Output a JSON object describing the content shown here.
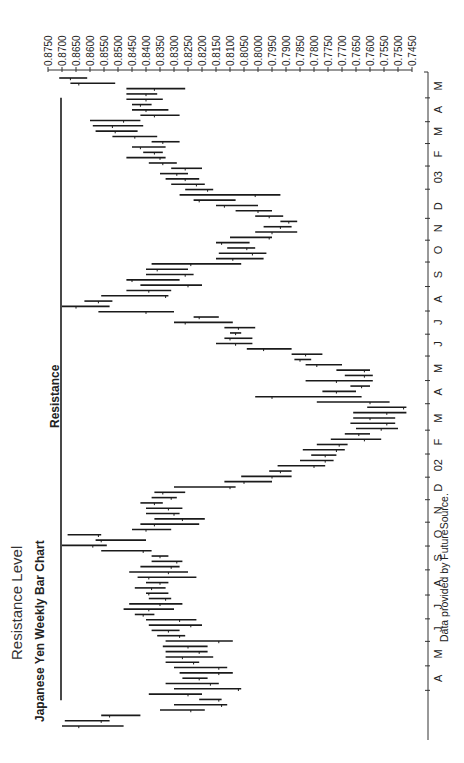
{
  "header": {
    "section_title": "Resistance Level",
    "chart_title": "Japanese Yen Weekly Bar Chart"
  },
  "annotation": {
    "resistance_label": "Resistance"
  },
  "footer": {
    "credit": "Data provided by FutureSource."
  },
  "colors": {
    "bars": "#1a1a1a",
    "axis": "#333333",
    "text": "#222222",
    "background": "#ffffff"
  },
  "chart_data": {
    "type": "bar",
    "subtype": "ohlc_weekly",
    "title": "Japanese Yen Weekly Bar Chart",
    "subtitle": "Resistance Level",
    "xlabel": "",
    "ylabel": "",
    "ylim": [
      0.745,
      0.875
    ],
    "y_ticks": [
      "0.8750",
      "0.8700",
      "0.8650",
      "0.8600",
      "0.8550",
      "0.8500",
      "0.8450",
      "0.8400",
      "0.8350",
      "0.8300",
      "0.8250",
      "0.8200",
      "0.8150",
      "0.8100",
      "0.8050",
      "0.8000",
      "0.7950",
      "0.7900",
      "0.7850",
      "0.7800",
      "0.7750",
      "0.7700",
      "0.7650",
      "0.7600",
      "0.7550",
      "0.7500",
      "0.7450"
    ],
    "x_ticks": [
      "A",
      "M",
      "J",
      "J",
      "A",
      "S",
      "O",
      "N",
      "D",
      "02",
      "F",
      "M",
      "A",
      "M",
      "J",
      "J",
      "A",
      "S",
      "O",
      "N",
      "D",
      "03",
      "F",
      "M",
      "A",
      "M"
    ],
    "x_tick_frac": [
      0.075,
      0.112,
      0.149,
      0.183,
      0.219,
      0.257,
      0.293,
      0.329,
      0.363,
      0.397,
      0.432,
      0.468,
      0.508,
      0.543,
      0.58,
      0.613,
      0.648,
      0.685,
      0.722,
      0.755,
      0.788,
      0.832,
      0.867,
      0.901,
      0.934,
      0.97
    ],
    "resistance_level": 0.87,
    "resistance_span_frac": [
      0.06,
      0.97
    ],
    "grid": false,
    "legend": null,
    "bars": [
      {
        "low": 0.848,
        "high": 0.87,
        "close": 0.864
      },
      {
        "low": 0.853,
        "high": 0.869,
        "close": 0.856
      },
      {
        "low": 0.842,
        "high": 0.856,
        "close": 0.853
      },
      {
        "low": 0.819,
        "high": 0.835,
        "close": 0.824
      },
      {
        "low": 0.811,
        "high": 0.83,
        "close": 0.813
      },
      {
        "low": 0.813,
        "high": 0.821,
        "close": 0.814
      },
      {
        "low": 0.82,
        "high": 0.839,
        "close": 0.825
      },
      {
        "low": 0.806,
        "high": 0.83,
        "close": 0.807
      },
      {
        "low": 0.814,
        "high": 0.833,
        "close": 0.817
      },
      {
        "low": 0.818,
        "high": 0.827,
        "close": 0.821
      },
      {
        "low": 0.809,
        "high": 0.828,
        "close": 0.814
      },
      {
        "low": 0.811,
        "high": 0.83,
        "close": 0.814
      },
      {
        "low": 0.821,
        "high": 0.833,
        "close": 0.823
      },
      {
        "low": 0.816,
        "high": 0.833,
        "close": 0.827
      },
      {
        "low": 0.818,
        "high": 0.833,
        "close": 0.821
      },
      {
        "low": 0.818,
        "high": 0.834,
        "close": 0.825
      },
      {
        "low": 0.809,
        "high": 0.833,
        "close": 0.814
      },
      {
        "low": 0.826,
        "high": 0.836,
        "close": 0.828
      },
      {
        "low": 0.828,
        "high": 0.838,
        "close": 0.832
      },
      {
        "low": 0.82,
        "high": 0.839,
        "close": 0.824
      },
      {
        "low": 0.822,
        "high": 0.84,
        "close": 0.828
      },
      {
        "low": 0.837,
        "high": 0.844,
        "close": 0.841
      },
      {
        "low": 0.83,
        "high": 0.848,
        "close": 0.839
      },
      {
        "low": 0.827,
        "high": 0.846,
        "close": 0.835
      },
      {
        "low": 0.831,
        "high": 0.839,
        "close": 0.833
      },
      {
        "low": 0.832,
        "high": 0.84,
        "close": 0.839
      },
      {
        "low": 0.833,
        "high": 0.844,
        "close": 0.838
      },
      {
        "low": 0.832,
        "high": 0.84,
        "close": 0.835
      },
      {
        "low": 0.822,
        "high": 0.843,
        "close": 0.839
      },
      {
        "low": 0.825,
        "high": 0.846,
        "close": 0.832
      },
      {
        "low": 0.828,
        "high": 0.842,
        "close": 0.831
      },
      {
        "low": 0.827,
        "high": 0.838,
        "close": 0.829
      },
      {
        "low": 0.832,
        "high": 0.838,
        "close": 0.835
      },
      {
        "low": 0.838,
        "high": 0.856,
        "close": 0.841
      },
      {
        "low": 0.854,
        "high": 0.87,
        "close": 0.859
      },
      {
        "low": 0.84,
        "high": 0.858,
        "close": 0.856
      },
      {
        "low": 0.856,
        "high": 0.868,
        "close": 0.857
      },
      {
        "low": 0.831,
        "high": 0.845,
        "close": 0.84
      },
      {
        "low": 0.821,
        "high": 0.842,
        "close": 0.837
      },
      {
        "low": 0.819,
        "high": 0.837,
        "close": 0.827
      },
      {
        "low": 0.828,
        "high": 0.84,
        "close": 0.83
      },
      {
        "low": 0.827,
        "high": 0.84,
        "close": 0.832
      },
      {
        "low": 0.834,
        "high": 0.842,
        "close": 0.837
      },
      {
        "low": 0.829,
        "high": 0.838,
        "close": 0.831
      },
      {
        "low": 0.826,
        "high": 0.837,
        "close": 0.834
      },
      {
        "low": 0.808,
        "high": 0.83,
        "close": 0.81
      },
      {
        "low": 0.795,
        "high": 0.812,
        "close": 0.805
      },
      {
        "low": 0.788,
        "high": 0.806,
        "close": 0.795
      },
      {
        "low": 0.788,
        "high": 0.796,
        "close": 0.792
      },
      {
        "low": 0.776,
        "high": 0.793,
        "close": 0.78
      },
      {
        "low": 0.773,
        "high": 0.785,
        "close": 0.776
      },
      {
        "low": 0.772,
        "high": 0.781,
        "close": 0.776
      },
      {
        "low": 0.769,
        "high": 0.784,
        "close": 0.772
      },
      {
        "low": 0.768,
        "high": 0.779,
        "close": 0.771
      },
      {
        "low": 0.756,
        "high": 0.774,
        "close": 0.762
      },
      {
        "low": 0.76,
        "high": 0.769,
        "close": 0.764
      },
      {
        "low": 0.75,
        "high": 0.765,
        "close": 0.756
      },
      {
        "low": 0.751,
        "high": 0.767,
        "close": 0.754
      },
      {
        "low": 0.751,
        "high": 0.766,
        "close": 0.76
      },
      {
        "low": 0.747,
        "high": 0.766,
        "close": 0.754
      },
      {
        "low": 0.747,
        "high": 0.761,
        "close": 0.748
      },
      {
        "low": 0.753,
        "high": 0.779,
        "close": 0.76
      },
      {
        "low": 0.763,
        "high": 0.801,
        "close": 0.795
      },
      {
        "low": 0.765,
        "high": 0.777,
        "close": 0.772
      },
      {
        "low": 0.76,
        "high": 0.767,
        "close": 0.763
      },
      {
        "low": 0.759,
        "high": 0.783,
        "close": 0.772
      },
      {
        "low": 0.759,
        "high": 0.769,
        "close": 0.762
      },
      {
        "low": 0.76,
        "high": 0.772,
        "close": 0.762
      },
      {
        "low": 0.77,
        "high": 0.783,
        "close": 0.779
      },
      {
        "low": 0.781,
        "high": 0.787,
        "close": 0.785
      },
      {
        "low": 0.777,
        "high": 0.788,
        "close": 0.783
      },
      {
        "low": 0.788,
        "high": 0.804,
        "close": 0.798
      },
      {
        "low": 0.802,
        "high": 0.815,
        "close": 0.808
      },
      {
        "low": 0.802,
        "high": 0.812,
        "close": 0.81
      },
      {
        "low": 0.806,
        "high": 0.81,
        "close": 0.808
      },
      {
        "low": 0.801,
        "high": 0.812,
        "close": 0.807
      },
      {
        "low": 0.809,
        "high": 0.83,
        "close": 0.826
      },
      {
        "low": 0.814,
        "high": 0.823,
        "close": 0.821
      },
      {
        "low": 0.83,
        "high": 0.857,
        "close": 0.84
      },
      {
        "low": 0.853,
        "high": 0.87,
        "close": 0.865
      },
      {
        "low": 0.852,
        "high": 0.862,
        "close": 0.857
      },
      {
        "low": 0.832,
        "high": 0.856,
        "close": 0.833
      },
      {
        "low": 0.831,
        "high": 0.847,
        "close": 0.839
      },
      {
        "low": 0.82,
        "high": 0.842,
        "close": 0.825
      },
      {
        "low": 0.828,
        "high": 0.847,
        "close": 0.845
      },
      {
        "low": 0.823,
        "high": 0.84,
        "close": 0.826
      },
      {
        "low": 0.825,
        "high": 0.84,
        "close": 0.836
      },
      {
        "low": 0.806,
        "high": 0.838,
        "close": 0.824
      },
      {
        "low": 0.798,
        "high": 0.815,
        "close": 0.809
      },
      {
        "low": 0.797,
        "high": 0.814,
        "close": 0.802
      },
      {
        "low": 0.801,
        "high": 0.811,
        "close": 0.804
      },
      {
        "low": 0.803,
        "high": 0.815,
        "close": 0.813
      },
      {
        "low": 0.795,
        "high": 0.81,
        "close": 0.796
      },
      {
        "low": 0.786,
        "high": 0.801,
        "close": 0.795
      },
      {
        "low": 0.788,
        "high": 0.798,
        "close": 0.792
      },
      {
        "low": 0.786,
        "high": 0.792,
        "close": 0.789
      },
      {
        "low": 0.791,
        "high": 0.801,
        "close": 0.796
      },
      {
        "low": 0.795,
        "high": 0.808,
        "close": 0.8
      },
      {
        "low": 0.8,
        "high": 0.815,
        "close": 0.812
      },
      {
        "low": 0.808,
        "high": 0.823,
        "close": 0.821
      },
      {
        "low": 0.792,
        "high": 0.828,
        "close": 0.801
      },
      {
        "low": 0.816,
        "high": 0.826,
        "close": 0.818
      },
      {
        "low": 0.819,
        "high": 0.831,
        "close": 0.822
      },
      {
        "low": 0.821,
        "high": 0.833,
        "close": 0.826
      },
      {
        "low": 0.825,
        "high": 0.835,
        "close": 0.829
      },
      {
        "low": 0.82,
        "high": 0.831,
        "close": 0.826
      },
      {
        "low": 0.829,
        "high": 0.839,
        "close": 0.834
      },
      {
        "low": 0.833,
        "high": 0.847,
        "close": 0.835
      },
      {
        "low": 0.834,
        "high": 0.841,
        "close": 0.837
      },
      {
        "low": 0.833,
        "high": 0.845,
        "close": 0.842
      },
      {
        "low": 0.828,
        "high": 0.838,
        "close": 0.834
      },
      {
        "low": 0.836,
        "high": 0.852,
        "close": 0.844
      },
      {
        "low": 0.843,
        "high": 0.858,
        "close": 0.851
      },
      {
        "low": 0.841,
        "high": 0.859,
        "close": 0.852
      },
      {
        "low": 0.842,
        "high": 0.86,
        "close": 0.848
      },
      {
        "low": 0.828,
        "high": 0.842,
        "close": 0.837
      },
      {
        "low": 0.832,
        "high": 0.845,
        "close": 0.84
      },
      {
        "low": 0.838,
        "high": 0.845,
        "close": 0.842
      },
      {
        "low": 0.834,
        "high": 0.847,
        "close": 0.84
      },
      {
        "low": 0.836,
        "high": 0.847,
        "close": 0.84
      },
      {
        "low": 0.826,
        "high": 0.847,
        "close": 0.837
      },
      {
        "low": 0.851,
        "high": 0.867,
        "close": 0.864
      },
      {
        "low": 0.861,
        "high": 0.871,
        "close": 0.867
      }
    ]
  }
}
